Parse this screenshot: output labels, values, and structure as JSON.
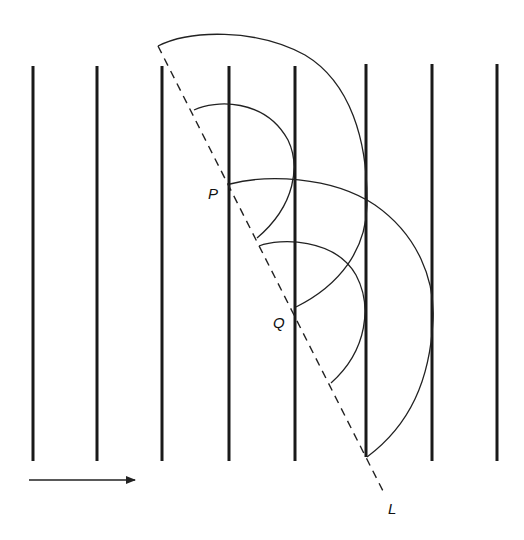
{
  "diagram": {
    "labels": {
      "P": "P",
      "Q": "Q",
      "L": "L"
    },
    "wavefront_count": 8,
    "arrow": "direction-arrow",
    "colors": {
      "line": "#1a1a1a",
      "background": "#ffffff"
    }
  }
}
